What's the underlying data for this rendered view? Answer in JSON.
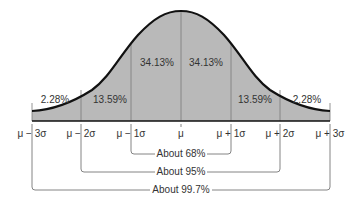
{
  "diagram": {
    "title": "",
    "type": "normal-distribution-empirical-rule",
    "colors": {
      "fill": "#b9b9b9",
      "curve": "#111111",
      "divider": "#7a7a7a",
      "bracket": "#666666",
      "text": "#333333"
    },
    "regions": [
      {
        "label": "2.28%"
      },
      {
        "label": "13.59%"
      },
      {
        "label": "34.13%"
      },
      {
        "label": "34.13%"
      },
      {
        "label": "13.59%"
      },
      {
        "label": "2.28%"
      }
    ],
    "axis_ticks": [
      "μ − 3σ",
      "μ − 2σ",
      "μ − 1σ",
      "μ",
      "μ + 1σ",
      "μ + 2σ",
      "μ + 3σ"
    ],
    "brackets": [
      {
        "label": "About 68%"
      },
      {
        "label": "About 95%"
      },
      {
        "label": "About 99.7%"
      }
    ]
  }
}
